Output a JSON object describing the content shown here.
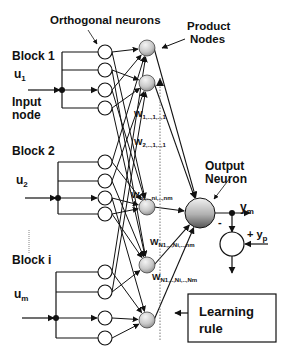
{
  "labels": {
    "orthogonal": "Orthogonal neurons",
    "product_1": "Product",
    "product_2": "Nodes",
    "output_1": "Output",
    "output_2": "Neuron",
    "block1": "Block 1",
    "u1": "u",
    "u1_sub": "1",
    "input_1": "Input",
    "input_2": "node",
    "block2": "Block 2",
    "u2": "u",
    "u2_sub": "2",
    "blocki": "Block i",
    "um": "u",
    "um_sub": "m",
    "ym": "y",
    "ym_sub": "m",
    "yp": "+ y",
    "yp_sub": "p",
    "minus": "-",
    "learning_1": "Learning",
    "learning_2": "rule"
  },
  "weights": [
    {
      "main": "W",
      "sub": "1,..,1,..,1"
    },
    {
      "main": "W",
      "sub": "2,..,1,..,1"
    },
    {
      "main": "W",
      "sub": "ni,..,ni,..,nm"
    },
    {
      "main": "W",
      "sub": "N1,..,Ni,..,nm"
    },
    {
      "main": "W",
      "sub": "N1,..,Ni,..,Nm"
    }
  ],
  "colors": {
    "line": "#111111",
    "node_fill": "#ffffff",
    "product_light": "#f2f2f2",
    "product_dark": "#8a8a8a"
  }
}
